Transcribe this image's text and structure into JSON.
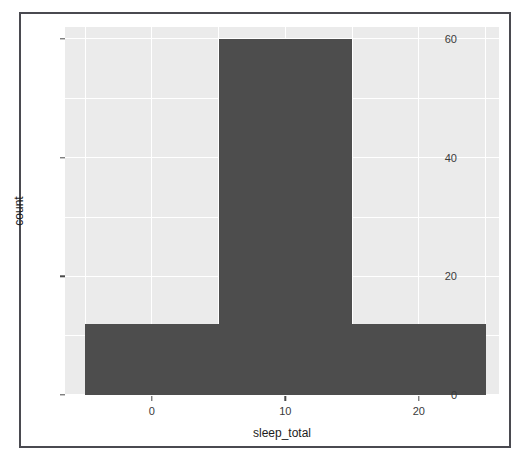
{
  "figure": {
    "background_color": "#ffffff",
    "frame_color": "#4a4a50",
    "panel_color": "#ebebeb",
    "grid_color": "#ffffff",
    "bar_color": "#4d4d4d"
  },
  "chart_data": {
    "type": "bar",
    "chart_subtype": "histogram",
    "title": "",
    "xlabel": "sleep_total",
    "ylabel": "count",
    "xlim": [
      -6.5,
      26.0
    ],
    "ylim": [
      0,
      62
    ],
    "grid": true,
    "legend": null,
    "binwidth": 10,
    "bins": [
      {
        "x_start": -5,
        "x_end": 5,
        "x_center": 0,
        "count": 12
      },
      {
        "x_start": 5,
        "x_end": 15,
        "x_center": 10,
        "count": 60
      },
      {
        "x_start": 15,
        "x_end": 25,
        "x_center": 20,
        "count": 12
      }
    ],
    "categories": [
      "-5 to 5",
      "5 to 15",
      "15 to 25"
    ],
    "values": [
      12,
      60,
      12
    ],
    "x_ticks": [
      {
        "value": 0,
        "label": "0"
      },
      {
        "value": 10,
        "label": "10"
      },
      {
        "value": 20,
        "label": "20"
      }
    ],
    "y_ticks": [
      {
        "value": 0,
        "label": "0"
      },
      {
        "value": 20,
        "label": "20"
      },
      {
        "value": 40,
        "label": "40"
      },
      {
        "value": 60,
        "label": "60"
      }
    ],
    "y_minor_ticks": [
      10,
      30,
      50
    ],
    "x_minor_ticks": [
      -5,
      5,
      15,
      25
    ]
  }
}
